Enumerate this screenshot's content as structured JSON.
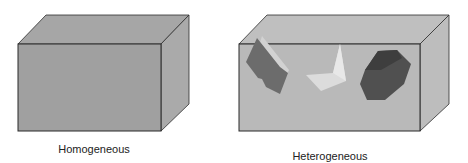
{
  "figure": {
    "panels": [
      {
        "id": "homogeneous",
        "label": "Homogeneous",
        "box_color": "#9f9f9f",
        "top_color": "#a4a4a4",
        "side_color": "#a8a8a8",
        "inclusions": []
      },
      {
        "id": "heterogeneous",
        "label": "Heterogeneous",
        "box_color": "#b9b9b9",
        "top_color": "#bdbdbd",
        "side_color": "#bcbcbc",
        "inclusions": [
          {
            "shape": "tilted-parallelogram",
            "color": "#6f6f6f"
          },
          {
            "shape": "light-chevron",
            "color": "#dedede"
          },
          {
            "shape": "hexagonal-prism",
            "color": "#4e4e4e"
          }
        ]
      }
    ],
    "edge_color": "#2a2a2a"
  }
}
